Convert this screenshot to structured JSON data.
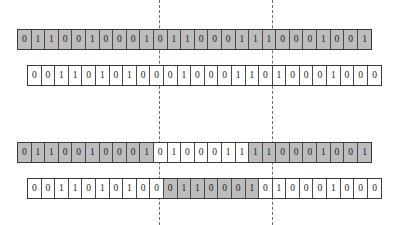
{
  "diagram": {
    "cell_count": 26,
    "colors": {
      "shaded": "#bdbdbd",
      "plain": "#ffffff",
      "border": "#3a3a3a",
      "cell_border": "#4a4a4a",
      "dashed_line": "#6e6e6e",
      "background": "#ffffff"
    },
    "guides": [
      {
        "name": "left-guide",
        "x": 159
      },
      {
        "name": "right-guide",
        "x": 272
      }
    ],
    "rows": [
      {
        "name": "row-1",
        "left": 17,
        "top": 29,
        "values": [
          "0",
          "1",
          "1",
          "0",
          "0",
          "1",
          "0",
          "0",
          "0",
          "1",
          "0",
          "1",
          "1",
          "0",
          "0",
          "0",
          "1",
          "1",
          "1",
          "0",
          "0",
          "0",
          "1",
          "0",
          "0",
          "1"
        ],
        "shading": [
          true,
          true,
          true,
          true,
          true,
          true,
          true,
          true,
          true,
          true,
          true,
          true,
          true,
          true,
          true,
          true,
          true,
          true,
          true,
          true,
          true,
          true,
          true,
          true,
          true,
          true
        ]
      },
      {
        "name": "row-2",
        "left": 27,
        "top": 65,
        "values": [
          "0",
          "0",
          "1",
          "1",
          "0",
          "1",
          "0",
          "1",
          "0",
          "0",
          "0",
          "1",
          "0",
          "0",
          "0",
          "1",
          "1",
          "0",
          "1",
          "0",
          "0",
          "0",
          "1",
          "0",
          "0",
          "0"
        ],
        "shading": [
          false,
          false,
          false,
          false,
          false,
          false,
          false,
          false,
          false,
          false,
          false,
          false,
          false,
          false,
          false,
          false,
          false,
          false,
          false,
          false,
          false,
          false,
          false,
          false,
          false,
          false
        ]
      },
      {
        "name": "row-3",
        "left": 17,
        "top": 142,
        "values": [
          "0",
          "1",
          "1",
          "0",
          "0",
          "1",
          "0",
          "0",
          "0",
          "1",
          "0",
          "1",
          "0",
          "0",
          "0",
          "1",
          "1",
          "1",
          "1",
          "0",
          "0",
          "0",
          "1",
          "0",
          "0",
          "1"
        ],
        "shading": [
          true,
          true,
          true,
          true,
          true,
          true,
          true,
          true,
          true,
          true,
          false,
          false,
          false,
          false,
          false,
          false,
          false,
          true,
          true,
          true,
          true,
          true,
          true,
          true,
          true,
          true
        ]
      },
      {
        "name": "row-4",
        "left": 27,
        "top": 178,
        "values": [
          "0",
          "0",
          "1",
          "1",
          "0",
          "1",
          "0",
          "1",
          "0",
          "0",
          "0",
          "1",
          "1",
          "0",
          "0",
          "0",
          "1",
          "0",
          "1",
          "0",
          "0",
          "0",
          "1",
          "0",
          "0",
          "0"
        ],
        "shading": [
          false,
          false,
          false,
          false,
          false,
          false,
          false,
          false,
          false,
          false,
          true,
          true,
          true,
          true,
          true,
          true,
          true,
          false,
          false,
          false,
          false,
          false,
          false,
          false,
          false,
          false
        ]
      }
    ]
  }
}
